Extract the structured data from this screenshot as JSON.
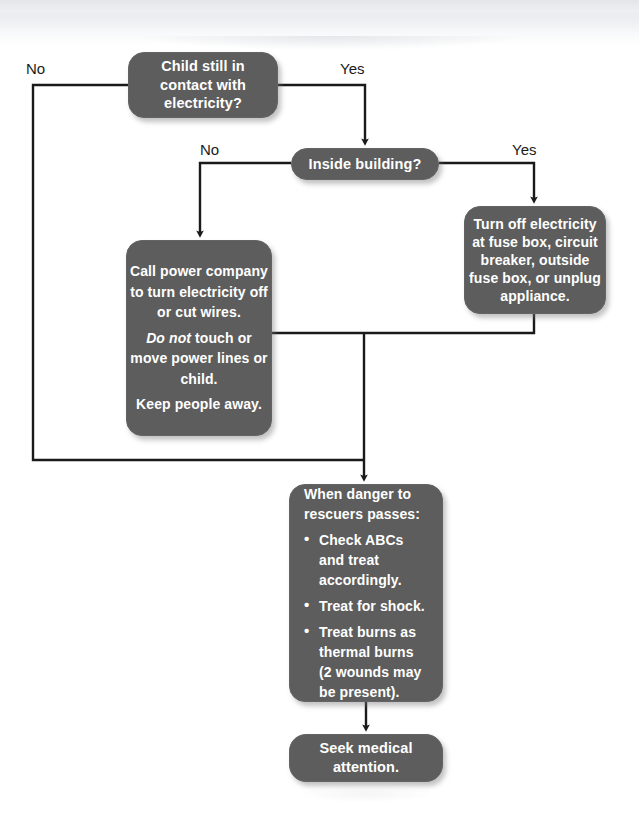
{
  "diagram": {
    "theme": {
      "node_fill": "#5d5d5d",
      "node_text": "#ffffff",
      "connector": "#1a1a1a",
      "page_background": "#ffffff"
    },
    "nodes": {
      "contact": {
        "id": "child-contact-electricity",
        "shape": "rounded-rectangle",
        "lines": [
          "Child still in",
          "contact with",
          "electricity?"
        ]
      },
      "inside": {
        "id": "inside-building",
        "shape": "pill",
        "lines": [
          "Inside building?"
        ]
      },
      "turn_off": {
        "id": "turn-off-electricity",
        "shape": "rounded-rectangle",
        "lines": [
          "Turn off electricity",
          "at fuse box, circuit",
          "breaker, outside",
          "fuse box, or unplug",
          "appliance."
        ]
      },
      "call_power": {
        "id": "call-power-company",
        "shape": "rounded-rectangle",
        "paragraphs": [
          {
            "text": "Call power company to turn electricity off or cut wires."
          },
          {
            "emphasis": "Do not",
            "text": " touch or move power lines or child."
          },
          {
            "text": "Keep people away."
          }
        ]
      },
      "when_danger": {
        "id": "when-danger-passes",
        "shape": "rounded-rectangle",
        "intro": "When danger to rescuers passes:",
        "bullet_glyph": "•",
        "bullets": [
          "Check ABCs and treat accordingly.",
          "Treat for shock.",
          "Treat burns as thermal burns (2 wounds may be present)."
        ]
      },
      "seek": {
        "id": "seek-medical-attention",
        "shape": "pill",
        "lines": [
          "Seek medical",
          "attention."
        ]
      }
    },
    "branch_labels": {
      "contact_no": "No",
      "contact_yes": "Yes",
      "inside_no": "No",
      "inside_yes": "Yes"
    }
  }
}
